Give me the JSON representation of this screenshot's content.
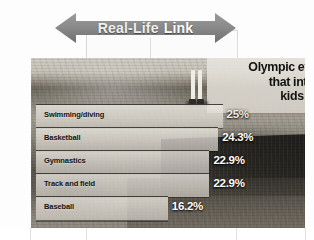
{
  "banner": {
    "text_primary": "Real-Life",
    "text_secondary": "Link",
    "shape": "double-arrow",
    "fill_color": "#8a8a8a"
  },
  "chart_panel": {
    "headline_lines": [
      "Olympic events",
      "that interest",
      "kids most"
    ],
    "background": "photograph"
  },
  "chart_data": {
    "type": "bar",
    "title": "Olympic events that interest kids most",
    "orientation": "horizontal",
    "categories": [
      "Swimming/diving",
      "Basketball",
      "Gymnastics",
      "Track and field",
      "Baseball"
    ],
    "values": [
      25.0,
      24.3,
      22.9,
      22.9,
      16.2
    ],
    "value_labels": [
      "25%",
      "24.3%",
      "22.9%",
      "22.9%",
      "16.2%"
    ],
    "xlabel": "",
    "ylabel": "",
    "xlim": [
      0,
      27
    ],
    "grid": false,
    "legend": false,
    "units": "percent"
  }
}
